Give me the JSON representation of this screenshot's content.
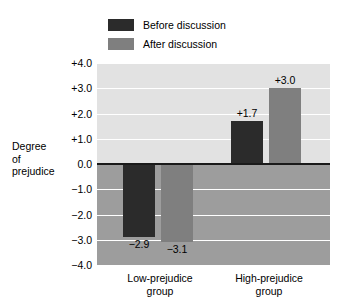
{
  "chart_data": {
    "type": "bar",
    "title": "",
    "xlabel": "",
    "ylabel": "Degree of prejudice",
    "categories": [
      "Low-prejudice group",
      "High-prejudice group"
    ],
    "series": [
      {
        "name": "Before discussion",
        "color": "#2b2b2b",
        "values": [
          -2.9,
          1.7
        ],
        "labels": [
          "−2.9",
          "+1.7"
        ]
      },
      {
        "name": "After discussion",
        "color": "#7f7f7f",
        "values": [
          -3.1,
          3.0
        ],
        "labels": [
          "−3.1",
          "+3.0"
        ]
      }
    ],
    "ylim": [
      -4.0,
      4.0
    ],
    "ytick_values": [
      4.0,
      3.0,
      2.0,
      1.0,
      0.0,
      -1.0,
      -2.0,
      -3.0,
      -4.0
    ],
    "ytick_labels": [
      "+4.0",
      "+3.0",
      "+2.0",
      "+1.0",
      "0.0",
      "−1.0",
      "−2.0",
      "−3.0",
      "−4.0"
    ],
    "grid": true,
    "legend_position": "top-left",
    "plot_bg_positive": "#e2e2e2",
    "plot_bg_negative": "#9d9d9d",
    "gridline_color": "#ffffff",
    "zero_line_color": "#1a1a1a"
  },
  "legend": {
    "items": [
      {
        "label": "Before discussion",
        "color": "#2b2b2b"
      },
      {
        "label": "After discussion",
        "color": "#7f7f7f"
      }
    ]
  },
  "axis": {
    "title_line1": "Degree",
    "title_line2": "of",
    "title_line3": "prejudice",
    "tick_0": "+4.0",
    "tick_1": "+3.0",
    "tick_2": "+2.0",
    "tick_3": "+1.0",
    "tick_4": "0.0",
    "tick_5": "−1.0",
    "tick_6": "−2.0",
    "tick_7": "−3.0",
    "tick_8": "−4.0"
  },
  "categories": {
    "left_line1": "Low-prejudice",
    "left_line2": "group",
    "right_line1": "High-prejudice",
    "right_line2": "group"
  },
  "values": {
    "low_before": "−2.9",
    "low_after": "−3.1",
    "high_before": "+1.7",
    "high_after": "+3.0"
  }
}
